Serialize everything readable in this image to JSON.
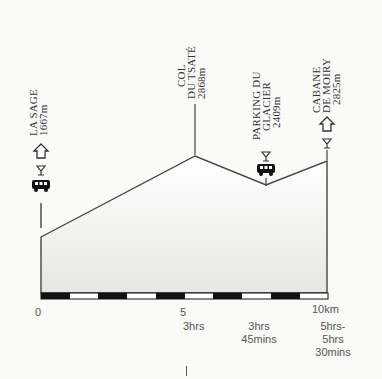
{
  "chart_data": {
    "type": "area",
    "title": "",
    "xlabel": "Distance (km)",
    "ylabel": "Altitude (m)",
    "x_ticks": [
      "0",
      "5",
      "10km"
    ],
    "xlim": [
      0,
      10
    ],
    "grid": false,
    "points": [
      {
        "name": "LA SAGE",
        "altitude": "1667m",
        "x_km": 0,
        "icons": [
          "hut-icon",
          "bar-icon",
          "bus-icon"
        ]
      },
      {
        "name": "COL DU TSATÉ",
        "altitude": "2868m",
        "x_km": 5.4,
        "icons": []
      },
      {
        "name": "PARKING DU GLACIER",
        "altitude": "2409m",
        "x_km": 8.2,
        "icons": [
          "bar-icon",
          "bus-icon"
        ]
      },
      {
        "name": "CABANE DE MOIRY",
        "altitude": "2825m",
        "x_km": 10,
        "icons": [
          "hut-icon",
          "bar-icon"
        ]
      }
    ],
    "times": [
      {
        "at": "5",
        "label": "3hrs"
      },
      {
        "at": "parking",
        "label": "3hrs 45mins"
      },
      {
        "at": "10km",
        "label": "5hrs- 5hrs 30mins"
      }
    ]
  },
  "labels": {
    "la_sage": {
      "l1": "LA SAGE",
      "l2": "1667m"
    },
    "col": {
      "l1": "COL",
      "l2": "DU TSATÉ",
      "l3": "2868m"
    },
    "parking": {
      "l1": "PARKING DU",
      "l2": "GLACIER",
      "l3": "2409m"
    },
    "cabane": {
      "l1": "CABANE",
      "l2": "DE MOIRY",
      "l3": "2825m"
    }
  },
  "axis": {
    "x0": "0",
    "x5": "5",
    "x10": "10km",
    "t1": "3hrs",
    "t2a": "3hrs",
    "t2b": "45mins",
    "t3a": "5hrs-",
    "t3b": "5hrs",
    "t3c": "30mins"
  },
  "colors": {
    "line": "#444444",
    "fill_top": "#ffffff",
    "fill_bottom": "#e8e8e6",
    "bar_dark": "#111111"
  }
}
